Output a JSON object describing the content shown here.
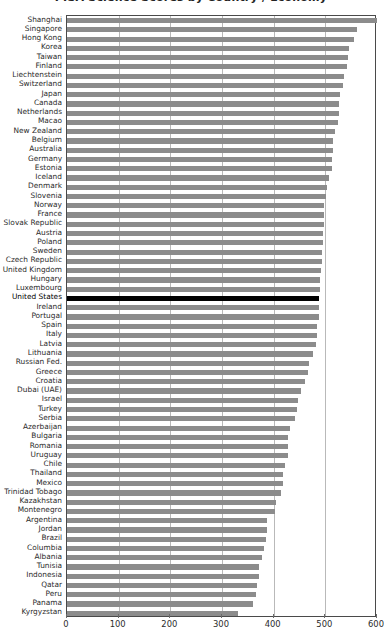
{
  "chart": {
    "title": "PISA Science Scores by Country / Economy",
    "title_clipped": true
  },
  "axis": {
    "x_ticks": [
      "0",
      "100",
      "200",
      "300",
      "400",
      "500",
      "600"
    ],
    "xlim_min": 0,
    "xlim_max": 600,
    "highlight_color": "#000000",
    "bar_color": "#8c8c8c"
  },
  "chart_data": {
    "type": "bar",
    "orientation": "horizontal",
    "title": "PISA Science Scores by Country / Economy",
    "xlabel": "",
    "ylabel": "",
    "xlim": [
      0,
      600
    ],
    "grid": true,
    "legend": "none",
    "highlight_category": "United States",
    "categories": [
      "Shanghai",
      "Singapore",
      "Hong Kong",
      "Korea",
      "Taiwan",
      "Finland",
      "Liechtenstein",
      "Switzerland",
      "Japan",
      "Canada",
      "Netherlands",
      "Macao",
      "New Zealand",
      "Belgium",
      "Australia",
      "Germany",
      "Estonia",
      "Iceland",
      "Denmark",
      "Slovenia",
      "Norway",
      "France",
      "Slovak Republic",
      "Austria",
      "Poland",
      "Sweden",
      "Czech Republic",
      "United Kingdom",
      "Hungary",
      "Luxembourg",
      "United States",
      "Ireland",
      "Portugal",
      "Spain",
      "Italy",
      "Latvia",
      "Lithuania",
      "Russian Fed.",
      "Greece",
      "Croatia",
      "Dubai (UAE)",
      "Israel",
      "Turkey",
      "Serbia",
      "Azerbaijan",
      "Bulgaria",
      "Romania",
      "Uruguay",
      "Chile",
      "Thailand",
      "Mexico",
      "Trinidad Tobago",
      "Kazakhstan",
      "Montenegro",
      "Argentina",
      "Jordan",
      "Brazil",
      "Columbia",
      "Albania",
      "Tunisia",
      "Indonesia",
      "Qatar",
      "Peru",
      "Panama",
      "Kyrgyzstan"
    ],
    "values": [
      600,
      562,
      555,
      546,
      543,
      541,
      536,
      534,
      529,
      527,
      526,
      525,
      519,
      515,
      514,
      513,
      512,
      507,
      503,
      501,
      498,
      497,
      497,
      496,
      495,
      494,
      493,
      492,
      490,
      489,
      487,
      487,
      487,
      483,
      483,
      482,
      477,
      468,
      466,
      460,
      453,
      447,
      445,
      442,
      431,
      428,
      427,
      427,
      421,
      419,
      419,
      414,
      405,
      403,
      388,
      387,
      386,
      381,
      377,
      371,
      371,
      368,
      365,
      360,
      331
    ]
  }
}
